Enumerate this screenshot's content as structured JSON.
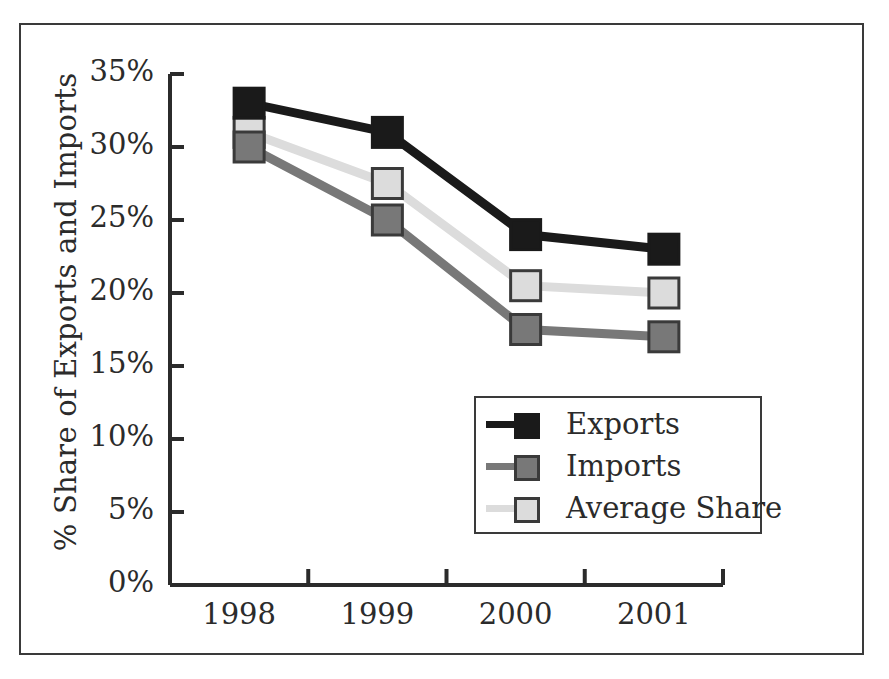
{
  "chart_data": {
    "type": "line",
    "title": "",
    "xlabel": "",
    "ylabel": "% Share of Exports and Imports",
    "categories": [
      "1998",
      "1999",
      "2000",
      "2001"
    ],
    "ylim": [
      0,
      35
    ],
    "ytick_values": [
      0,
      5,
      10,
      15,
      20,
      25,
      30,
      35
    ],
    "ytick_labels": [
      "0%",
      "5%",
      "10%",
      "15%",
      "20%",
      "25%",
      "30%",
      "35%"
    ],
    "grid": false,
    "legend_position": "center-right-inside",
    "series": [
      {
        "name": "Exports",
        "values": [
          33,
          31,
          24,
          23
        ],
        "color": "#1a1a1a",
        "marker_fill": "#1a1a1a",
        "marker_edge": "#1a1a1a"
      },
      {
        "name": "Imports",
        "values": [
          30,
          25,
          17.5,
          17
        ],
        "color": "#787878",
        "marker_fill": "#787878",
        "marker_edge": "#3a3a3a"
      },
      {
        "name": "Average Share",
        "values": [
          31,
          27.5,
          20.5,
          20
        ],
        "color": "#dcdcdc",
        "marker_fill": "#dcdcdc",
        "marker_edge": "#3a3a3a"
      }
    ]
  },
  "legend": {
    "items": [
      {
        "label": "Exports"
      },
      {
        "label": "Imports"
      },
      {
        "label": "Average Share"
      }
    ]
  },
  "axes": {
    "y_title": "% Share of Exports and Imports"
  }
}
